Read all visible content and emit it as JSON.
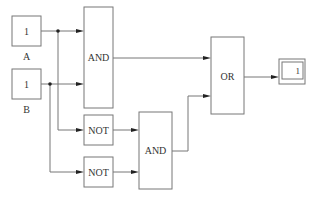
{
  "diagram": {
    "type": "logic-circuit",
    "inputs": [
      {
        "id": "A",
        "value": "1",
        "label": "A"
      },
      {
        "id": "B",
        "value": "1",
        "label": "B"
      }
    ],
    "gates": [
      {
        "id": "and1",
        "label": "AND"
      },
      {
        "id": "not1",
        "label": "NOT"
      },
      {
        "id": "not2",
        "label": "NOT"
      },
      {
        "id": "and2",
        "label": "AND"
      },
      {
        "id": "or1",
        "label": "OR"
      }
    ],
    "output": {
      "id": "display",
      "value": "1"
    },
    "connections": [
      [
        "A",
        "and1"
      ],
      [
        "B",
        "and1"
      ],
      [
        "A",
        "not1"
      ],
      [
        "B",
        "not2"
      ],
      [
        "not1",
        "and2"
      ],
      [
        "not2",
        "and2"
      ],
      [
        "and1",
        "or1"
      ],
      [
        "and2",
        "or1"
      ],
      [
        "or1",
        "display"
      ]
    ]
  }
}
